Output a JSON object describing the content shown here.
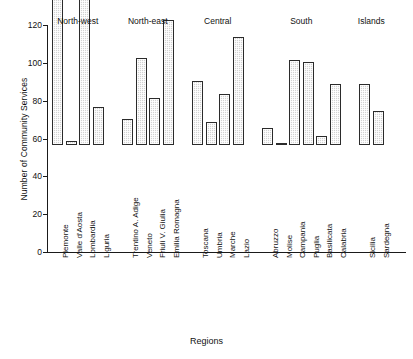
{
  "chart_data": {
    "type": "bar",
    "title": "",
    "xlabel": "Regions",
    "ylabel": "Number of Community Services",
    "ylim": [
      0,
      120
    ],
    "yticks": [
      0,
      20,
      40,
      60,
      80,
      100,
      120
    ],
    "grid": false,
    "legend": "none",
    "groups": [
      {
        "name": "North-west",
        "categories": [
          "Piemonte",
          "Valle d'Aosta",
          "Lombardia",
          "Liguria"
        ],
        "values": [
          78,
          2,
          96,
          20
        ]
      },
      {
        "name": "North-east",
        "categories": [
          "Trentino A. Adige",
          "Veneto",
          "Friuli V. Giulia",
          "Emilia Romagna"
        ],
        "values": [
          14,
          46,
          25,
          66
        ]
      },
      {
        "name": "Central",
        "categories": [
          "Toscana",
          "Umbria",
          "Marche",
          "Lazio"
        ],
        "values": [
          34,
          12,
          27,
          57
        ]
      },
      {
        "name": "South",
        "categories": [
          "Abruzzo",
          "Molise",
          "Campania",
          "Puglia",
          "Basilicata",
          "Calabria"
        ],
        "values": [
          9,
          1,
          45,
          44,
          5,
          32
        ]
      },
      {
        "name": "Islands",
        "categories": [
          "Sicilia",
          "Sardegna"
        ],
        "values": [
          32,
          18
        ]
      }
    ],
    "categories": [
      "Piemonte",
      "Valle d'Aosta",
      "Lombardia",
      "Liguria",
      "Trentino A. Adige",
      "Veneto",
      "Friuli V. Giulia",
      "Emilia Romagna",
      "Toscana",
      "Umbria",
      "Marche",
      "Lazio",
      "Abruzzo",
      "Molise",
      "Campania",
      "Puglia",
      "Basilicata",
      "Calabria",
      "Sicilia",
      "Sardegna"
    ],
    "values": [
      78,
      2,
      96,
      20,
      14,
      46,
      25,
      66,
      34,
      12,
      27,
      57,
      9,
      1,
      45,
      44,
      5,
      32,
      32,
      18
    ],
    "bar_fill_color": "#d2d2d2",
    "bar_border_color": "#2b2b2b",
    "axis_color": "#1a1a1a",
    "background_color": "#ffffff"
  }
}
